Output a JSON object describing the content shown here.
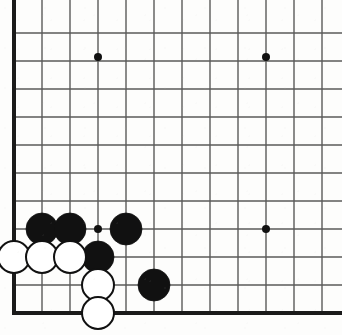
{
  "board": {
    "title": "Go board position",
    "game": "Go (Weiqi/Baduk)",
    "board_size": 19,
    "view": {
      "description": "bottom-left corner view, top and right of board cropped",
      "width_px": 342,
      "height_px": 335
    },
    "colors": {
      "background": "#fdfdfc",
      "grid_line": "#5a5a5a",
      "border_line": "#1a1a1a",
      "black_stone": "#111111",
      "white_stone_fill": "#ffffff",
      "white_stone_edge": "#111111",
      "star_point": "#111111"
    },
    "geometry": {
      "origin_x": 14,
      "origin_y": 33,
      "spacing": 28,
      "columns_x": [
        14,
        42,
        70,
        98,
        126,
        154,
        182,
        210,
        238,
        266,
        294,
        322
      ],
      "rows_y": [
        33,
        61,
        89,
        117,
        145,
        173,
        201,
        229,
        257,
        285,
        313
      ],
      "stone_radius": 16,
      "star_radius": 4,
      "edge_line_width": 4,
      "grid_line_width": 1.4
    },
    "star_points": [
      {
        "name": "star-point-1",
        "x": 98,
        "y": 57
      },
      {
        "name": "star-point-2",
        "x": 266,
        "y": 57
      },
      {
        "name": "star-point-3",
        "x": 98,
        "y": 229
      },
      {
        "name": "star-point-4",
        "x": 266,
        "y": 229
      }
    ],
    "edges": {
      "left": {
        "x": 14,
        "y1": 0,
        "y2": 313
      },
      "bottom": {
        "y": 313,
        "x1": 14,
        "x2": 342
      }
    },
    "stones": [
      {
        "id": "stone-black-1",
        "color": "black",
        "x": 42,
        "y": 229
      },
      {
        "id": "stone-black-2",
        "color": "black",
        "x": 70,
        "y": 229
      },
      {
        "id": "stone-black-3",
        "color": "black",
        "x": 126,
        "y": 229
      },
      {
        "id": "stone-black-4",
        "color": "black",
        "x": 98,
        "y": 257
      },
      {
        "id": "stone-black-5",
        "color": "black",
        "x": 154,
        "y": 285
      },
      {
        "id": "stone-white-1",
        "color": "white",
        "x": 14,
        "y": 257
      },
      {
        "id": "stone-white-2",
        "color": "white",
        "x": 42,
        "y": 257
      },
      {
        "id": "stone-white-3",
        "color": "white",
        "x": 70,
        "y": 257
      },
      {
        "id": "stone-white-4",
        "color": "white",
        "x": 98,
        "y": 285
      },
      {
        "id": "stone-white-5",
        "color": "white",
        "x": 98,
        "y": 313
      }
    ],
    "counts": {
      "black_stones": 5,
      "white_stones": 5
    }
  }
}
